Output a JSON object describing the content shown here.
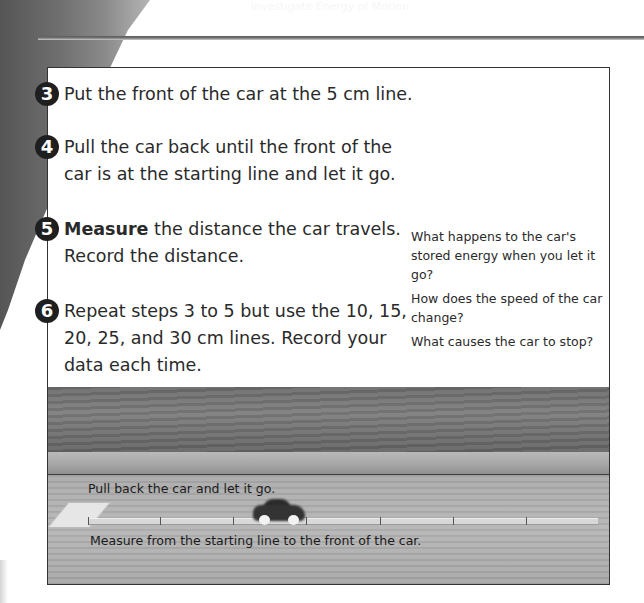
{
  "page": {
    "heading": "Investigate Energy of Motion"
  },
  "steps": [
    {
      "number": "3",
      "bold": "",
      "text": "Put the front of the car at the 5 cm line."
    },
    {
      "number": "4",
      "bold": "",
      "line1": "Pull the car back until the front of the",
      "line2": "car is at the starting line and let it go."
    },
    {
      "number": "5",
      "bold": "Measure",
      "line1": " the distance the car travels.",
      "line2": "Record the distance."
    },
    {
      "number": "6",
      "bold": "",
      "line1": "Repeat steps 3 to 5 but use the 10, 15,",
      "line2": "20, 25, and 30 cm lines. Record your",
      "line3": "data each time."
    }
  ],
  "questions": [
    "What happens to the car's stored energy when you let it go?",
    "How does the speed of the car change?",
    "What causes the car to stop?"
  ],
  "photo": {
    "caption_top": "Pull back the car and let it go.",
    "caption_bottom": "Measure from the starting line to the front of the car.",
    "start_card_label": "start line"
  },
  "colors": {
    "step_circle": "#1f1f1f",
    "border": "#333333",
    "rule": "#5a5a5a"
  }
}
